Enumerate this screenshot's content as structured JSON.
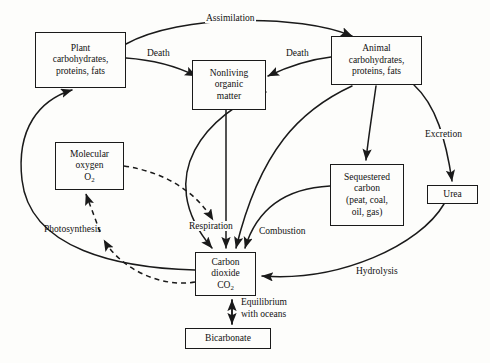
{
  "diagram": {
    "type": "flow-diagram",
    "colors": {
      "stroke": "#1a1a1a",
      "background": "#fdfdfb",
      "text": "#111111"
    },
    "nodes": [
      {
        "id": "plant",
        "label": "Plant\ncarbohydrates,\nproteins, fats",
        "line1": "Plant",
        "line2": "carbohydrates,",
        "line3": "proteins, fats",
        "x": 35,
        "y": 32,
        "w": 91,
        "h": 56
      },
      {
        "id": "nonliving",
        "label": "Nonliving\norganic\nmatter",
        "line1": "Nonliving",
        "line2": "organic",
        "line3": "matter",
        "x": 192,
        "y": 60,
        "w": 74,
        "h": 50
      },
      {
        "id": "animal",
        "label": "Animal\ncarbohydrates,\nproteins, fats",
        "line1": "Animal",
        "line2": "carbohydrates,",
        "line3": "proteins, fats",
        "x": 331,
        "y": 36,
        "w": 91,
        "h": 49
      },
      {
        "id": "oxygen",
        "label": "Molecular\noxygen\nO2",
        "line1": "Molecular",
        "line2": "oxygen",
        "line3": "O",
        "sub3": "2",
        "x": 55,
        "y": 142,
        "w": 69,
        "h": 48
      },
      {
        "id": "sequestered",
        "label": "Sequestered\ncarbon\n(peat, coal,\noil, gas)",
        "line1": "Sequestered",
        "line2": "carbon",
        "line3": "(peat, coal,",
        "line4": "oil, gas)",
        "x": 330,
        "y": 164,
        "w": 74,
        "h": 62
      },
      {
        "id": "urea",
        "label": "Urea",
        "line1": "Urea",
        "x": 427,
        "y": 185,
        "w": 51,
        "h": 19
      },
      {
        "id": "co2",
        "label": "Carbon\ndioxide\nCO2",
        "line1": "Carbon",
        "line2": "dioxide",
        "line3": "CO",
        "sub3": "2",
        "x": 195,
        "y": 252,
        "w": 61,
        "h": 44
      },
      {
        "id": "bicarbonate",
        "label": "Bicarbonate",
        "line1": "Bicarbonate",
        "x": 185,
        "y": 328,
        "w": 86,
        "h": 21
      }
    ],
    "edge_labels": [
      {
        "id": "assimilation",
        "text": "Assimilation",
        "x": 205,
        "y": 13
      },
      {
        "id": "death-left",
        "text": "Death",
        "x": 146,
        "y": 48
      },
      {
        "id": "death-right",
        "text": "Death",
        "x": 285,
        "y": 48
      },
      {
        "id": "excretion",
        "text": "Excretion",
        "x": 424,
        "y": 129
      },
      {
        "id": "photosynthesis",
        "text": "Photosynthesis",
        "x": 43,
        "y": 224
      },
      {
        "id": "respiration",
        "text": "Respiration",
        "x": 188,
        "y": 221
      },
      {
        "id": "combustion",
        "text": "Combustion",
        "x": 258,
        "y": 226
      },
      {
        "id": "hydrolysis",
        "text": "Hydrolysis",
        "x": 355,
        "y": 266
      },
      {
        "id": "equilibrium-1",
        "text": "Equilibrium",
        "x": 247,
        "y": 298
      },
      {
        "id": "equilibrium-2",
        "text": "with oceans",
        "x": 247,
        "y": 310
      }
    ],
    "edges": [
      {
        "id": "plant-to-animal-assimilation",
        "from": "plant",
        "to": "animal",
        "label": "Assimilation",
        "style": "solid"
      },
      {
        "id": "plant-to-nonliving-death",
        "from": "plant",
        "to": "nonliving",
        "label": "Death",
        "style": "solid"
      },
      {
        "id": "animal-to-nonliving-death",
        "from": "animal",
        "to": "nonliving",
        "label": "Death",
        "style": "solid"
      },
      {
        "id": "animal-to-urea-excretion",
        "from": "animal",
        "to": "urea",
        "label": "Excretion",
        "style": "solid"
      },
      {
        "id": "animal-to-sequestered",
        "from": "animal",
        "to": "sequestered",
        "label": "",
        "style": "solid"
      },
      {
        "id": "nonliving-to-co2",
        "from": "nonliving",
        "to": "co2",
        "label": "Respiration",
        "style": "solid"
      },
      {
        "id": "nonliving-to-respiration",
        "from": "nonliving",
        "to": "co2",
        "label": "Respiration",
        "style": "solid"
      },
      {
        "id": "animal-to-co2-respiration",
        "from": "animal",
        "to": "co2",
        "label": "Respiration",
        "style": "solid"
      },
      {
        "id": "sequestered-to-co2-combustion",
        "from": "sequestered",
        "to": "co2",
        "label": "Combustion",
        "style": "solid"
      },
      {
        "id": "urea-to-co2-hydrolysis",
        "from": "urea",
        "to": "co2",
        "label": "Hydrolysis",
        "style": "solid"
      },
      {
        "id": "co2-to-plant-photosynthesis",
        "from": "co2",
        "to": "plant",
        "label": "Photosynthesis",
        "style": "solid"
      },
      {
        "id": "co2-to-oxygen-dashed",
        "from": "co2",
        "to": "oxygen",
        "label": "Photosynthesis",
        "style": "dashed"
      },
      {
        "id": "oxygen-to-respiration-dashed",
        "from": "oxygen",
        "to": "co2",
        "label": "Respiration",
        "style": "dashed"
      },
      {
        "id": "co2-bicarbonate-equilibrium",
        "from": "co2",
        "to": "bicarbonate",
        "label": "Equilibrium with oceans",
        "style": "solid",
        "bidirectional": true
      }
    ]
  }
}
